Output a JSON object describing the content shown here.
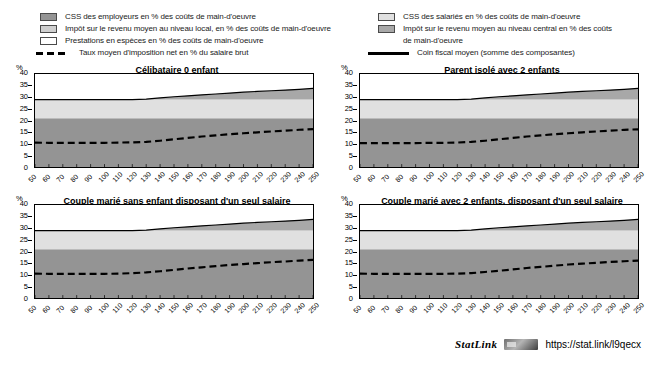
{
  "legend": {
    "left_items": [
      {
        "key": "employer-social-contributions",
        "swatch": "sw-employer",
        "label": "CSS des employeurs en % des coûts de main-d'oeuvre"
      },
      {
        "key": "local-income-tax",
        "swatch": "sw-local",
        "label": "Impôt sur le revenu moyen au niveau local, en % des coûts de main-d'oeuvre"
      },
      {
        "key": "cash-benefits",
        "swatch": "sw-benefit",
        "label": "Prestations en espèces en % des coûts de main-d'oeuvre"
      },
      {
        "key": "net-average-tax-rate",
        "swatch": "dashed",
        "label": "Taux moyen d'imposition net en % du salaire brut"
      }
    ],
    "right_items": [
      {
        "key": "employee-social-contributions",
        "swatch": "sw-employee",
        "label": "CSS des salariés en % des coûts de main-d'oeuvre"
      },
      {
        "key": "central-income-tax",
        "swatch": "sw-central",
        "label": "Impôt sur le revenu moyen au niveau central en %  des coûts"
      },
      {
        "key": "central-income-tax-cont",
        "swatch": "none",
        "label": "de main-d'oeuvre"
      },
      {
        "key": "average-tax-wedge",
        "swatch": "solid",
        "label": "Coin fiscal moyen (somme des composantes)"
      }
    ]
  },
  "footer": {
    "statlink_label": "StatLink",
    "statlink_icon": "statlink-barcode-icon",
    "url": "https://stat.link/l9qecx"
  },
  "colors": {
    "employer": "#949494",
    "employee": "#e0e0e0",
    "local_tax": "#cfcfcf",
    "central_tax": "#a8a8a8",
    "benefits": "#ffffff",
    "wedge_line": "#000000",
    "net_rate_line": "#000000"
  },
  "chart_data": [
    {
      "type": "area",
      "title": "Célibataire 0 enfant",
      "xlabel": "",
      "ylabel": "%",
      "ylim": [
        0,
        40
      ],
      "yticks": [
        0,
        5,
        10,
        15,
        20,
        25,
        30,
        35,
        40
      ],
      "grid": false,
      "legend_position": "top",
      "x": [
        50,
        60,
        70,
        80,
        90,
        100,
        110,
        120,
        130,
        140,
        150,
        160,
        170,
        180,
        190,
        200,
        210,
        220,
        230,
        240,
        250
      ],
      "series": [
        {
          "name": "CSS des employeurs en % des coûts de main-d'oeuvre",
          "values": [
            21.0,
            21.0,
            21.0,
            21.0,
            21.0,
            21.0,
            21.0,
            21.0,
            21.0,
            21.0,
            21.0,
            21.0,
            21.0,
            21.0,
            21.0,
            21.0,
            21.0,
            21.0,
            21.0,
            21.0,
            21.0
          ]
        },
        {
          "name": "CSS des salariés en % des coûts de main-d'oeuvre",
          "values": [
            8.0,
            8.0,
            8.0,
            8.0,
            8.0,
            8.0,
            8.0,
            8.0,
            8.0,
            8.0,
            8.0,
            8.0,
            8.0,
            8.0,
            8.0,
            8.0,
            8.0,
            8.0,
            8.0,
            8.0,
            8.0
          ]
        },
        {
          "name": "Impôt sur le revenu moyen au niveau central en %  des coûts de main-d'oeuvre",
          "values": [
            0.0,
            0.0,
            0.0,
            0.0,
            0.0,
            0.0,
            0.0,
            0.0,
            0.2,
            0.7,
            1.2,
            1.6,
            2.0,
            2.4,
            2.8,
            3.2,
            3.5,
            3.8,
            4.1,
            4.4,
            4.8
          ]
        },
        {
          "name": "Impôt sur le revenu moyen au niveau local, en % des coûts de main-d'oeuvre",
          "values": [
            0.0,
            0.0,
            0.0,
            0.0,
            0.0,
            0.0,
            0.0,
            0.0,
            0.0,
            0.0,
            0.0,
            0.0,
            0.0,
            0.0,
            0.0,
            0.0,
            0.0,
            0.0,
            0.0,
            0.0,
            0.0
          ]
        },
        {
          "name": "Prestations en espèces en % des coûts de main-d'oeuvre",
          "values": [
            0.0,
            0.0,
            0.0,
            0.0,
            0.0,
            0.0,
            0.0,
            0.0,
            0.0,
            0.0,
            0.0,
            0.0,
            0.0,
            0.0,
            0.0,
            0.0,
            0.0,
            0.0,
            0.0,
            0.0,
            0.0
          ]
        }
      ],
      "lines": [
        {
          "name": "Coin fiscal moyen (somme des composantes)",
          "style": "solid",
          "values": [
            29.0,
            29.0,
            29.0,
            29.0,
            29.0,
            29.0,
            29.0,
            29.0,
            29.2,
            29.7,
            30.2,
            30.6,
            31.0,
            31.4,
            31.8,
            32.2,
            32.5,
            32.8,
            33.1,
            33.4,
            33.8
          ]
        },
        {
          "name": "Taux moyen d'imposition net en % du salaire brut",
          "style": "dashed",
          "values": [
            10.5,
            10.4,
            10.4,
            10.4,
            10.4,
            10.4,
            10.5,
            10.6,
            10.8,
            11.3,
            11.9,
            12.5,
            13.1,
            13.6,
            14.1,
            14.5,
            14.9,
            15.3,
            15.6,
            16.0,
            16.3
          ]
        }
      ]
    },
    {
      "type": "area",
      "title": "Parent isolé avec 2 enfants",
      "xlabel": "",
      "ylabel": "%",
      "ylim": [
        0,
        40
      ],
      "yticks": [
        0,
        5,
        10,
        15,
        20,
        25,
        30,
        35,
        40
      ],
      "grid": false,
      "legend_position": "top",
      "x": [
        50,
        60,
        70,
        80,
        90,
        100,
        110,
        120,
        130,
        140,
        150,
        160,
        170,
        180,
        190,
        200,
        210,
        220,
        230,
        240,
        250
      ],
      "series": [
        {
          "name": "CSS des employeurs en % des coûts de main-d'oeuvre",
          "values": [
            21.0,
            21.0,
            21.0,
            21.0,
            21.0,
            21.0,
            21.0,
            21.0,
            21.0,
            21.0,
            21.0,
            21.0,
            21.0,
            21.0,
            21.0,
            21.0,
            21.0,
            21.0,
            21.0,
            21.0,
            21.0
          ]
        },
        {
          "name": "CSS des salariés en % des coûts de main-d'oeuvre",
          "values": [
            8.0,
            8.0,
            8.0,
            8.0,
            8.0,
            8.0,
            8.0,
            8.0,
            8.0,
            8.0,
            8.0,
            8.0,
            8.0,
            8.0,
            8.0,
            8.0,
            8.0,
            8.0,
            8.0,
            8.0,
            8.0
          ]
        },
        {
          "name": "Impôt sur le revenu moyen au niveau central en %  des coûts de main-d'oeuvre",
          "values": [
            0.0,
            0.0,
            0.0,
            0.0,
            0.0,
            0.0,
            0.0,
            0.0,
            0.2,
            0.7,
            1.2,
            1.6,
            2.0,
            2.4,
            2.8,
            3.2,
            3.5,
            3.8,
            4.1,
            4.4,
            4.8
          ]
        },
        {
          "name": "Impôt sur le revenu moyen au niveau local, en % des coûts de main-d'oeuvre",
          "values": [
            0.0,
            0.0,
            0.0,
            0.0,
            0.0,
            0.0,
            0.0,
            0.0,
            0.0,
            0.0,
            0.0,
            0.0,
            0.0,
            0.0,
            0.0,
            0.0,
            0.0,
            0.0,
            0.0,
            0.0,
            0.0
          ]
        },
        {
          "name": "Prestations en espèces en % des coûts de main-d'oeuvre",
          "values": [
            0.0,
            0.0,
            0.0,
            0.0,
            0.0,
            0.0,
            0.0,
            0.0,
            0.0,
            0.0,
            0.0,
            0.0,
            0.0,
            0.0,
            0.0,
            0.0,
            0.0,
            0.0,
            0.0,
            0.0,
            0.0
          ]
        }
      ],
      "lines": [
        {
          "name": "Coin fiscal moyen (somme des composantes)",
          "style": "solid",
          "values": [
            29.0,
            29.0,
            29.0,
            29.0,
            29.0,
            29.0,
            29.0,
            29.0,
            29.2,
            29.7,
            30.2,
            30.6,
            31.0,
            31.4,
            31.8,
            32.2,
            32.5,
            32.8,
            33.1,
            33.4,
            33.8
          ]
        },
        {
          "name": "Taux moyen d'imposition net en % du salaire brut",
          "style": "dashed",
          "values": [
            10.3,
            10.3,
            10.3,
            10.3,
            10.3,
            10.4,
            10.4,
            10.5,
            10.8,
            11.3,
            11.9,
            12.5,
            13.1,
            13.6,
            14.1,
            14.5,
            14.9,
            15.3,
            15.6,
            16.0,
            16.2
          ]
        }
      ]
    },
    {
      "type": "area",
      "title": "Couple marié sans enfant disposant d'un seul salaire",
      "xlabel": "",
      "ylabel": "%",
      "ylim": [
        0,
        40
      ],
      "yticks": [
        0,
        5,
        10,
        15,
        20,
        25,
        30,
        35,
        40
      ],
      "grid": false,
      "legend_position": "top",
      "x": [
        50,
        60,
        70,
        80,
        90,
        100,
        110,
        120,
        130,
        140,
        150,
        160,
        170,
        180,
        190,
        200,
        210,
        220,
        230,
        240,
        250
      ],
      "series": [
        {
          "name": "CSS des employeurs en % des coûts de main-d'oeuvre",
          "values": [
            21.0,
            21.0,
            21.0,
            21.0,
            21.0,
            21.0,
            21.0,
            21.0,
            21.0,
            21.0,
            21.0,
            21.0,
            21.0,
            21.0,
            21.0,
            21.0,
            21.0,
            21.0,
            21.0,
            21.0,
            21.0
          ]
        },
        {
          "name": "CSS des salariés en % des coûts de main-d'oeuvre",
          "values": [
            8.0,
            8.0,
            8.0,
            8.0,
            8.0,
            8.0,
            8.0,
            8.0,
            8.0,
            8.0,
            8.0,
            8.0,
            8.0,
            8.0,
            8.0,
            8.0,
            8.0,
            8.0,
            8.0,
            8.0,
            8.0
          ]
        },
        {
          "name": "Impôt sur le revenu moyen au niveau central en %  des coûts de main-d'oeuvre",
          "values": [
            0.0,
            0.0,
            0.0,
            0.0,
            0.0,
            0.0,
            0.0,
            0.0,
            0.2,
            0.7,
            1.2,
            1.6,
            2.0,
            2.4,
            2.8,
            3.2,
            3.5,
            3.8,
            4.1,
            4.4,
            4.8
          ]
        },
        {
          "name": "Impôt sur le revenu moyen au niveau local, en % des coûts de main-d'oeuvre",
          "values": [
            0.0,
            0.0,
            0.0,
            0.0,
            0.0,
            0.0,
            0.0,
            0.0,
            0.0,
            0.0,
            0.0,
            0.0,
            0.0,
            0.0,
            0.0,
            0.0,
            0.0,
            0.0,
            0.0,
            0.0,
            0.0
          ]
        },
        {
          "name": "Prestations en espèces en % des coûts de main-d'oeuvre",
          "values": [
            0.0,
            0.0,
            0.0,
            0.0,
            0.0,
            0.0,
            0.0,
            0.0,
            0.0,
            0.0,
            0.0,
            0.0,
            0.0,
            0.0,
            0.0,
            0.0,
            0.0,
            0.0,
            0.0,
            0.0,
            0.0
          ]
        }
      ],
      "lines": [
        {
          "name": "Coin fiscal moyen (somme des composantes)",
          "style": "solid",
          "values": [
            29.0,
            29.0,
            29.0,
            29.0,
            29.0,
            29.0,
            29.0,
            29.0,
            29.2,
            29.7,
            30.2,
            30.6,
            31.0,
            31.4,
            31.8,
            32.2,
            32.5,
            32.8,
            33.1,
            33.4,
            33.8
          ]
        },
        {
          "name": "Taux moyen d'imposition net en % du salaire brut",
          "style": "dashed",
          "values": [
            10.5,
            10.4,
            10.4,
            10.4,
            10.4,
            10.4,
            10.5,
            10.7,
            11.0,
            11.5,
            12.1,
            12.7,
            13.2,
            13.7,
            14.2,
            14.6,
            15.0,
            15.4,
            15.7,
            16.1,
            16.4
          ]
        }
      ]
    },
    {
      "type": "area",
      "title": "Couple marié avec 2 enfants, disposant d'un seul salaire",
      "xlabel": "",
      "ylabel": "%",
      "ylim": [
        0,
        40
      ],
      "yticks": [
        0,
        5,
        10,
        15,
        20,
        25,
        30,
        35,
        40
      ],
      "grid": false,
      "legend_position": "top",
      "x": [
        50,
        60,
        70,
        80,
        90,
        100,
        110,
        120,
        130,
        140,
        150,
        160,
        170,
        180,
        190,
        200,
        210,
        220,
        230,
        240,
        250
      ],
      "series": [
        {
          "name": "CSS des employeurs en % des coûts de main-d'oeuvre",
          "values": [
            21.0,
            21.0,
            21.0,
            21.0,
            21.0,
            21.0,
            21.0,
            21.0,
            21.0,
            21.0,
            21.0,
            21.0,
            21.0,
            21.0,
            21.0,
            21.0,
            21.0,
            21.0,
            21.0,
            21.0,
            21.0
          ]
        },
        {
          "name": "CSS des salariés en % des coûts de main-d'oeuvre",
          "values": [
            8.0,
            8.0,
            8.0,
            8.0,
            8.0,
            8.0,
            8.0,
            8.0,
            8.0,
            8.0,
            8.0,
            8.0,
            8.0,
            8.0,
            8.0,
            8.0,
            8.0,
            8.0,
            8.0,
            8.0,
            8.0
          ]
        },
        {
          "name": "Impôt sur le revenu moyen au niveau central en %  des coûts de main-d'oeuvre",
          "values": [
            0.0,
            0.0,
            0.0,
            0.0,
            0.0,
            0.0,
            0.0,
            0.0,
            0.2,
            0.7,
            1.2,
            1.6,
            2.0,
            2.4,
            2.8,
            3.2,
            3.5,
            3.8,
            4.1,
            4.4,
            4.8
          ]
        },
        {
          "name": "Impôt sur le revenu moyen au niveau local, en % des coûts de main-d'oeuvre",
          "values": [
            0.0,
            0.0,
            0.0,
            0.0,
            0.0,
            0.0,
            0.0,
            0.0,
            0.0,
            0.0,
            0.0,
            0.0,
            0.0,
            0.0,
            0.0,
            0.0,
            0.0,
            0.0,
            0.0,
            0.0,
            0.0
          ]
        },
        {
          "name": "Prestations en espèces en % des coûts de main-d'oeuvre",
          "values": [
            0.0,
            0.0,
            0.0,
            0.0,
            0.0,
            0.0,
            0.0,
            0.0,
            0.0,
            0.0,
            0.0,
            0.0,
            0.0,
            0.0,
            0.0,
            0.0,
            0.0,
            0.0,
            0.0,
            0.0,
            0.0
          ]
        }
      ],
      "lines": [
        {
          "name": "Coin fiscal moyen (somme des composantes)",
          "style": "solid",
          "values": [
            29.0,
            29.0,
            29.0,
            29.0,
            29.0,
            29.0,
            29.0,
            29.0,
            29.2,
            29.7,
            30.2,
            30.6,
            31.0,
            31.4,
            31.8,
            32.2,
            32.5,
            32.8,
            33.1,
            33.4,
            33.8
          ]
        },
        {
          "name": "Taux moyen d'imposition net en % du salaire brut",
          "style": "dashed",
          "values": [
            10.5,
            10.4,
            10.4,
            10.4,
            10.4,
            10.4,
            10.4,
            10.5,
            10.7,
            11.2,
            11.7,
            12.3,
            12.9,
            13.4,
            13.9,
            14.4,
            14.8,
            15.1,
            15.5,
            15.8,
            16.1
          ]
        }
      ]
    }
  ]
}
